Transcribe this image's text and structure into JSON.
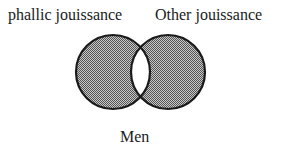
{
  "diagram": {
    "type": "venn",
    "labels": {
      "left": "phallic jouissance",
      "right": "Other jouissance",
      "bottom": "Men"
    },
    "circles": [
      {
        "name": "phallic jouissance",
        "cx": 113,
        "cy": 72,
        "r": 37
      },
      {
        "name": "Other jouissance",
        "cx": 168,
        "cy": 72,
        "r": 37
      }
    ],
    "colors": {
      "fill": "#8a8a8a",
      "stroke": "#1a1a1a",
      "intersection": "#ffffff"
    }
  }
}
